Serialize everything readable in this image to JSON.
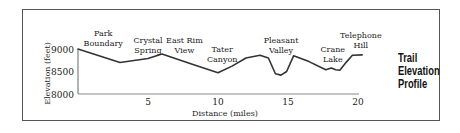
{
  "chart_data": {
    "type": "line",
    "title": [
      "Trail",
      "Elevation",
      "Profile"
    ],
    "xlabel": "Distance (miles)",
    "ylabel": "Elevation (feet)",
    "xlim": [
      0,
      21
    ],
    "ylim": [
      8000,
      9200
    ],
    "x_ticks": [
      5,
      10,
      15,
      20
    ],
    "y_ticks": [
      8000,
      8500,
      9000
    ],
    "grid": false,
    "legend": "none",
    "series": [
      {
        "name": "Elevation",
        "x": [
          0,
          3,
          5,
          6,
          8,
          10,
          11,
          12,
          13,
          13.6,
          14.1,
          14.5,
          14.9,
          15.4,
          16.5,
          17.7,
          18.1,
          18.4,
          18.7,
          19.2,
          19.6,
          20.3
        ],
        "y": [
          9000,
          8700,
          8790,
          8890,
          8680,
          8470,
          8620,
          8800,
          8860,
          8800,
          8450,
          8420,
          8500,
          8850,
          8720,
          8540,
          8580,
          8540,
          8530,
          8720,
          8860,
          8870
        ]
      }
    ],
    "annotations": [
      {
        "lines": [
          "Park",
          "Boundary"
        ],
        "x": 1.8
      },
      {
        "lines": [
          "Crystal",
          "Spring"
        ],
        "x": 5.0
      },
      {
        "lines": [
          "East Rim",
          "View"
        ],
        "x": 7.6
      },
      {
        "lines": [
          "Tater",
          "Canyon"
        ],
        "x": 10.3
      },
      {
        "lines": [
          "Pleasant",
          "Valley"
        ],
        "x": 14.5
      },
      {
        "lines": [
          "Crane",
          "Lake"
        ],
        "x": 18.2
      },
      {
        "lines": [
          "Telephone",
          "Hill"
        ],
        "x": 20.2
      }
    ]
  }
}
